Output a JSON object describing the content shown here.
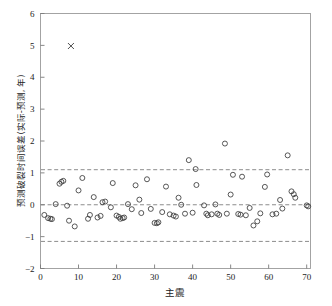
{
  "chart_data": {
    "type": "scatter",
    "title": "",
    "xlabel": "主震",
    "ylabel": "预测破裂时间误差(实际-预测, 年)",
    "xlim": [
      0,
      71
    ],
    "ylim": [
      -2,
      6
    ],
    "xticks": [
      0,
      10,
      20,
      30,
      40,
      50,
      60,
      70
    ],
    "yticks": [
      -2,
      -1,
      0,
      1,
      2,
      3,
      4,
      5,
      6
    ],
    "grid": false,
    "legend": null,
    "reference_lines": [
      {
        "name": "upper-bound",
        "y": 1.1,
        "style": "dashed"
      },
      {
        "name": "zero-line",
        "y": 0.0,
        "style": "dashed"
      },
      {
        "name": "lower-bound",
        "y": -1.15,
        "style": "dashed"
      }
    ],
    "series": [
      {
        "name": "residuals",
        "marker": "open-circle",
        "points": [
          [
            1,
            -0.32
          ],
          [
            2,
            -0.42
          ],
          [
            2.6,
            -0.44
          ],
          [
            3,
            -0.45
          ],
          [
            4,
            0.02
          ],
          [
            5,
            0.66
          ],
          [
            5.5,
            0.72
          ],
          [
            6,
            0.75
          ],
          [
            7,
            -0.03
          ],
          [
            7.5,
            -0.5
          ],
          [
            9,
            -0.68
          ],
          [
            10,
            0.45
          ],
          [
            11,
            0.84
          ],
          [
            12.5,
            -0.44
          ],
          [
            13,
            -0.32
          ],
          [
            14,
            0.24
          ],
          [
            15,
            -0.4
          ],
          [
            15.8,
            -0.35
          ],
          [
            16.3,
            0.08
          ],
          [
            17,
            0.1
          ],
          [
            18.5,
            -0.08
          ],
          [
            19,
            0.68
          ],
          [
            20,
            -0.34
          ],
          [
            20.6,
            -0.38
          ],
          [
            21,
            -0.44
          ],
          [
            21.6,
            -0.42
          ],
          [
            22,
            -0.4
          ],
          [
            23,
            0.02
          ],
          [
            24,
            -0.14
          ],
          [
            25,
            0.61
          ],
          [
            26,
            0.16
          ],
          [
            26.5,
            -0.26
          ],
          [
            28,
            0.8
          ],
          [
            29,
            -0.13
          ],
          [
            30,
            -0.57
          ],
          [
            30.6,
            -0.58
          ],
          [
            31,
            -0.55
          ],
          [
            32,
            -0.23
          ],
          [
            33,
            0.57
          ],
          [
            34,
            -0.3
          ],
          [
            35,
            -0.34
          ],
          [
            35.6,
            -0.37
          ],
          [
            36.3,
            0.22
          ],
          [
            37,
            0.0
          ],
          [
            38,
            -0.28
          ],
          [
            39,
            1.4
          ],
          [
            40,
            -0.25
          ],
          [
            40.8,
            1.12
          ],
          [
            41,
            0.62
          ],
          [
            43,
            -0.02
          ],
          [
            43.6,
            -0.28
          ],
          [
            44,
            -0.33
          ],
          [
            45,
            -0.3
          ],
          [
            46,
            0.01
          ],
          [
            46.5,
            -0.28
          ],
          [
            47,
            -0.32
          ],
          [
            48.5,
            1.92
          ],
          [
            49,
            -0.28
          ],
          [
            50,
            0.32
          ],
          [
            50.6,
            0.94
          ],
          [
            52,
            -0.29
          ],
          [
            52.6,
            -0.31
          ],
          [
            53,
            0.88
          ],
          [
            54,
            -0.33
          ],
          [
            55,
            -0.1
          ],
          [
            56,
            -0.65
          ],
          [
            57,
            -0.52
          ],
          [
            57.8,
            -0.27
          ],
          [
            59,
            0.56
          ],
          [
            59.6,
            0.95
          ],
          [
            61,
            -0.3
          ],
          [
            62,
            -0.28
          ],
          [
            63,
            0.15
          ],
          [
            63.6,
            -0.12
          ],
          [
            65,
            1.55
          ],
          [
            66,
            0.42
          ],
          [
            66.6,
            0.33
          ],
          [
            67,
            0.22
          ],
          [
            70,
            -0.02
          ],
          [
            70.4,
            -0.05
          ]
        ]
      },
      {
        "name": "outlier",
        "marker": "cross-x",
        "points": [
          [
            8,
            4.98
          ]
        ]
      }
    ]
  }
}
